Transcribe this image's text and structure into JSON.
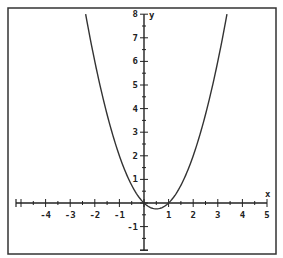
{
  "chart_data": {
    "type": "line",
    "title": "",
    "function": "y = x^2 - x",
    "xlabel": "x",
    "ylabel": "y",
    "xlim": [
      -5,
      5
    ],
    "ylim": [
      -2,
      8
    ],
    "grid": false,
    "legend": null,
    "x_ticks": [
      -4,
      -3,
      -2,
      -1,
      1,
      2,
      3,
      4,
      5
    ],
    "y_ticks": [
      -1,
      1,
      2,
      3,
      4,
      5,
      6,
      7,
      8
    ],
    "series": [
      {
        "name": "y = x^2 - x",
        "x": [
          -2.37,
          -2,
          -1.5,
          -1,
          -0.5,
          0,
          0.25,
          0.5,
          0.75,
          1,
          1.5,
          2,
          2.5,
          3,
          3.37
        ],
        "values": [
          8.0,
          6.0,
          3.75,
          2.0,
          0.75,
          0.0,
          -0.1875,
          -0.25,
          -0.1875,
          0.0,
          0.75,
          2.0,
          3.75,
          6.0,
          8.0
        ]
      }
    ],
    "key_points": {
      "roots": [
        0,
        1
      ],
      "vertex": [
        0.5,
        -0.25
      ]
    }
  },
  "labels": {
    "x_axis": "x",
    "y_axis": "y",
    "x_ticks": [
      "-4",
      "-3",
      "-2",
      "-1",
      "1",
      "2",
      "3",
      "4",
      "5"
    ],
    "y_ticks": [
      "-1",
      "1",
      "2",
      "3",
      "4",
      "5",
      "6",
      "7",
      "8"
    ]
  },
  "colors": {
    "frame": "#333333",
    "axis": "#222222",
    "curve": "#333333",
    "background": "#ffffff"
  }
}
